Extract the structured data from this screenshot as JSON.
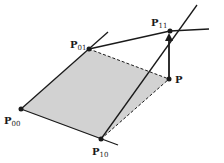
{
  "diagram": {
    "colors": {
      "fill": "#d2d2d2",
      "line": "#1a1a1a",
      "background": "#ffffff"
    },
    "points": [
      {
        "id": "P00",
        "label": "P",
        "sub": "00",
        "x": 21,
        "y": 109
      },
      {
        "id": "P01",
        "label": "P",
        "sub": "01",
        "x": 89,
        "y": 49
      },
      {
        "id": "P10",
        "label": "P",
        "sub": "10",
        "x": 101,
        "y": 139
      },
      {
        "id": "P11",
        "label": "P",
        "sub": "11",
        "x": 170,
        "y": 31
      },
      {
        "id": "P",
        "label": "P",
        "sub": "",
        "x": 169,
        "y": 79
      }
    ],
    "edges": [
      {
        "from": "P00",
        "to": "P01",
        "style": "solid"
      },
      {
        "from": "P00",
        "to": "P10",
        "style": "solid"
      },
      {
        "from": "P01",
        "to": "P11",
        "style": "solid"
      },
      {
        "from": "P10",
        "to": "P11",
        "style": "solid"
      },
      {
        "from": "P01",
        "to": "P",
        "style": "dashed"
      },
      {
        "from": "P10",
        "to": "P",
        "style": "dashed"
      },
      {
        "from": "P",
        "to": "P11",
        "style": "arrow"
      }
    ]
  }
}
